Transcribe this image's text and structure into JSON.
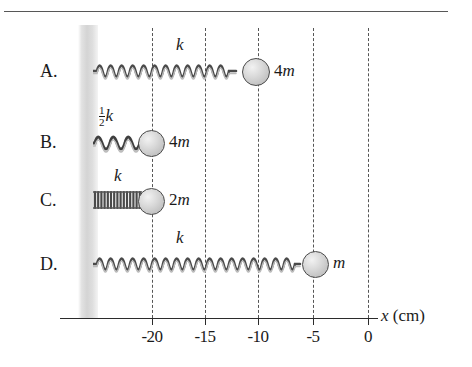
{
  "figure": {
    "type": "physics-diagram",
    "axis": {
      "label": "x (cm)",
      "label_symbol": "x",
      "label_unit": "(cm)",
      "ticks": [
        {
          "value": "-20",
          "x_px": 152
        },
        {
          "value": "-15",
          "x_px": 205
        },
        {
          "value": "-10",
          "x_px": 258
        },
        {
          "value": "-5",
          "x_px": 313
        },
        {
          "value": "0",
          "x_px": 368
        }
      ],
      "range_cm": [
        -20,
        0
      ],
      "gridlines": "dashed vertical at each tick"
    },
    "wall": {
      "name": "fixed-wall",
      "color": "#d4d4d4"
    },
    "rows": [
      {
        "letter": "A.",
        "spring_label": "k",
        "spring_label_type": "plain",
        "spring_constant": "k",
        "mass_label": "4m",
        "mass_number": "4",
        "mass_symbol": "m",
        "mass_position_cm": -10,
        "spring_style": "loose",
        "coils": 11
      },
      {
        "letter": "B.",
        "spring_label": "k",
        "spring_label_type": "fraction",
        "fraction_numerator": "1",
        "fraction_denominator": "2",
        "spring_constant": "1/2 k",
        "mass_label": "4m",
        "mass_number": "4",
        "mass_symbol": "m",
        "mass_position_cm": -21,
        "spring_style": "medium",
        "coils": 5
      },
      {
        "letter": "C.",
        "spring_label": "k",
        "spring_label_type": "plain",
        "spring_constant": "k",
        "mass_label": "2m",
        "mass_number": "2",
        "mass_symbol": "m",
        "mass_position_cm": -21,
        "spring_style": "tight",
        "coils": 15
      },
      {
        "letter": "D.",
        "spring_label": "k",
        "spring_label_type": "plain",
        "spring_constant": "k",
        "mass_label": "m",
        "mass_number": "",
        "mass_symbol": "m",
        "mass_position_cm": -5,
        "spring_style": "loose",
        "coils": 14
      }
    ]
  }
}
